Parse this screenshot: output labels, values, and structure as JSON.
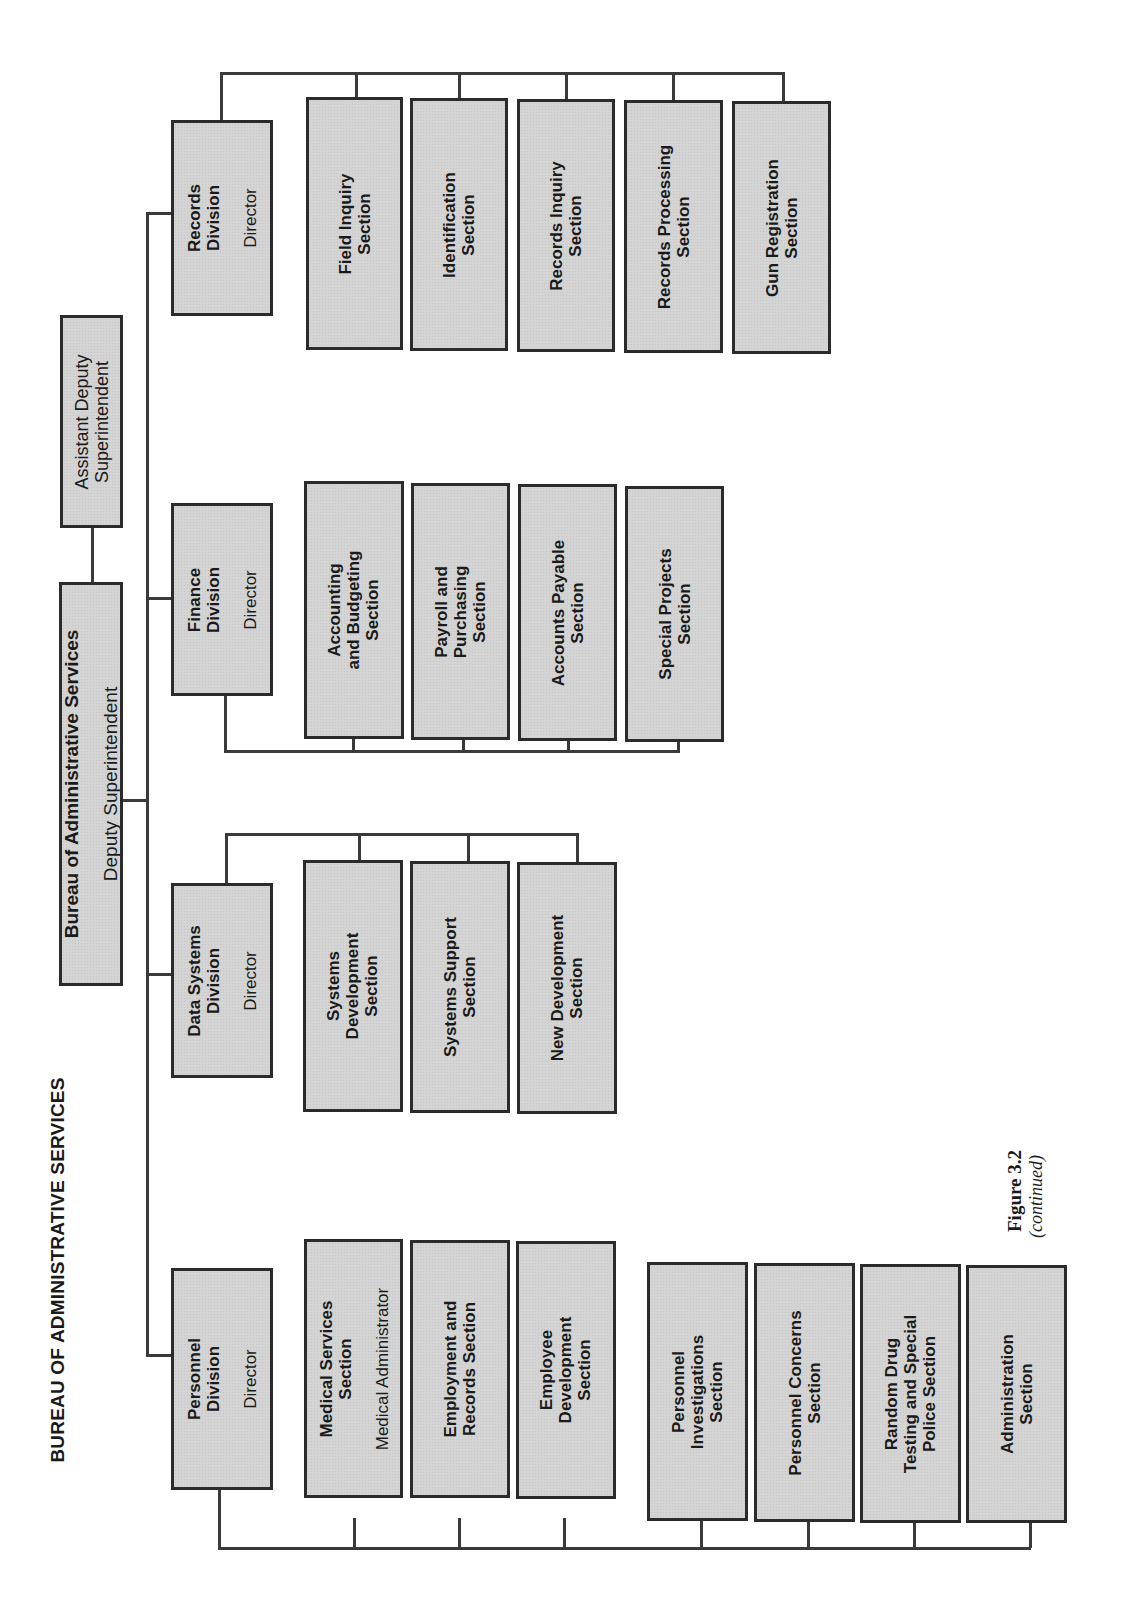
{
  "title": "BUREAU OF ADMINISTRATIVE SERVICES",
  "figure": {
    "label": "Figure 3.2",
    "note": "(continued)"
  },
  "bureau": {
    "name": "Bureau of Administrative Services",
    "head": "Deputy Superintendent"
  },
  "assistant": {
    "title": "Assistant Deputy\nSuperintendent"
  },
  "divisions": {
    "records": {
      "name": "Records\nDivision",
      "head": "Director",
      "sections": [
        "Field Inquiry\nSection",
        "Identification\nSection",
        "Records Inquiry\nSection",
        "Records Processing\nSection",
        "Gun Registration\nSection"
      ]
    },
    "finance": {
      "name": "Finance\nDivision",
      "head": "Director",
      "sections": [
        "Accounting\nand Budgeting\nSection",
        "Payroll and\nPurchasing\nSection",
        "Accounts Payable\nSection",
        "Special Projects\nSection"
      ]
    },
    "data_systems": {
      "name": "Data Systems\nDivision",
      "head": "Director",
      "sections": [
        "Systems\nDevelopment\nSection",
        "Systems Support\nSection",
        "New Development\nSection"
      ]
    },
    "personnel": {
      "name": "Personnel\nDivision",
      "head": "Director",
      "sections": [
        {
          "name": "Medical Services\nSection",
          "head": "Medical Administrator"
        },
        {
          "name": "Employment and\nRecords Section"
        },
        {
          "name": "Employee\nDevelopment\nSection"
        },
        {
          "name": "Personnel\nInvestigations\nSection"
        },
        {
          "name": "Personnel Concerns\nSection"
        },
        {
          "name": "Random Drug\nTesting and Special\nPolice Section"
        },
        {
          "name": "Administration\nSection"
        }
      ]
    }
  },
  "colors": {
    "box_fill": "#d4d4d4",
    "border": "#2b2b2b",
    "line": "#3a3a3a"
  }
}
